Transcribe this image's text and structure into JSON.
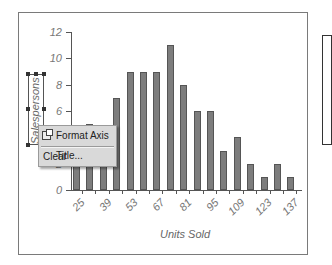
{
  "chart_data": {
    "type": "bar",
    "title": "",
    "xlabel": "Units Sold",
    "ylabel": "Salespersons",
    "categories": [
      "25",
      "32",
      "39",
      "46",
      "53",
      "60",
      "67",
      "74",
      "81",
      "88",
      "95",
      "102",
      "109",
      "116",
      "123",
      "130",
      "137"
    ],
    "values": [
      4,
      5,
      4,
      7,
      9,
      9,
      9,
      11,
      8,
      6,
      6,
      3,
      4,
      2,
      1,
      2,
      1
    ],
    "values_note": "bars at 25 and 39 are hidden behind the context menu; values estimated",
    "ylim": [
      0,
      12
    ],
    "yticks": [
      "0",
      "2",
      "4",
      "6",
      "8",
      "10",
      "12"
    ],
    "xtick_labels": [
      "25",
      "39",
      "53",
      "67",
      "81",
      "95",
      "109",
      "123",
      "137"
    ],
    "grid": false,
    "legend_position": "right",
    "bar_color": "#7d7d7d"
  },
  "context_menu": {
    "items": [
      {
        "label": "Format Axis Title...",
        "icon": "format-axis-title-icon"
      },
      {
        "label": "Clear"
      }
    ]
  }
}
